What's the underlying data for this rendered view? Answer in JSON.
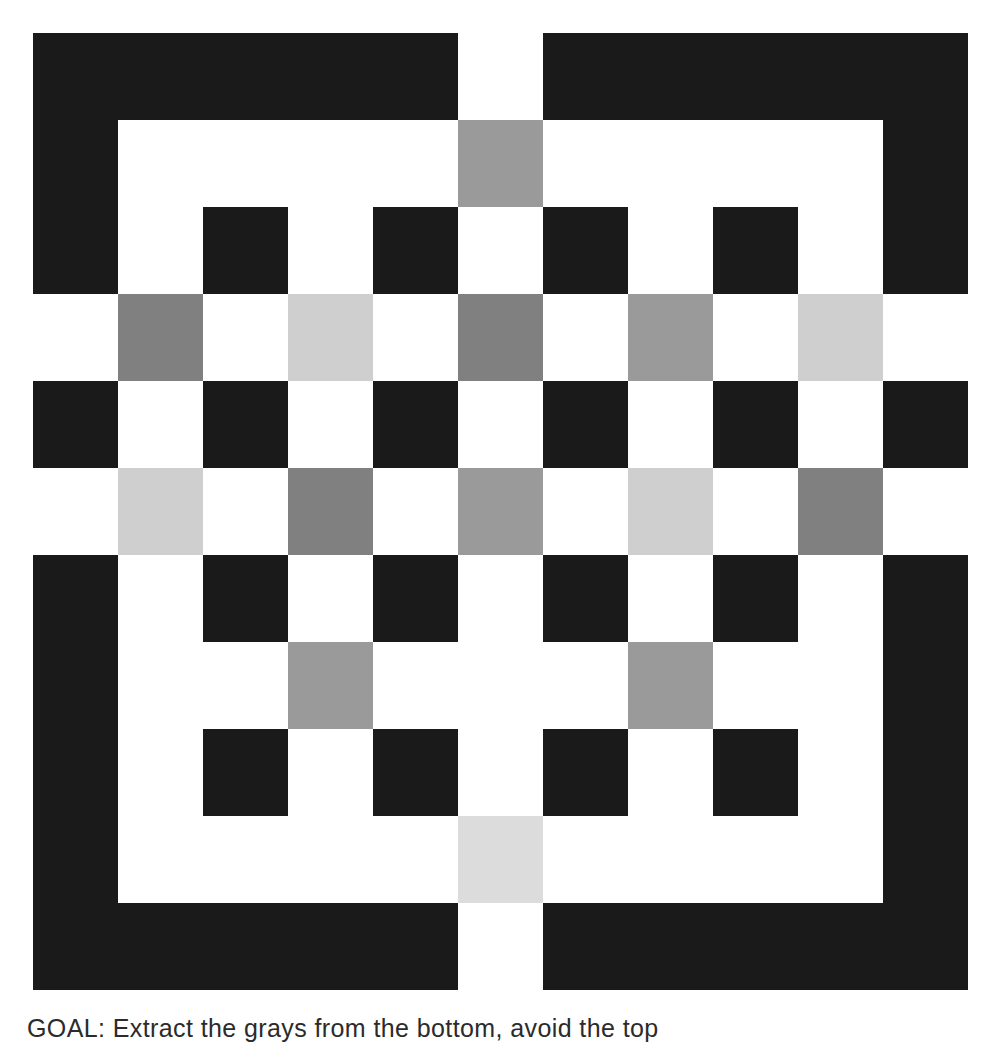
{
  "caption": {
    "label": "GOAL:",
    "text": " Extract the grays from the bottom, avoid the top"
  },
  "palette": {
    "white": "#ffffff",
    "black": "#1a1a1a",
    "gray_dark": "#808080",
    "gray_mid": "#9a9a9a",
    "gray_light": "#cfcfcf",
    "gray_pale": "#dcdcdc"
  },
  "grid": {
    "columns": 11,
    "rows": 11,
    "cell_width": 85,
    "cell_height": 87,
    "origin_x": 33,
    "origin_y": 33,
    "legend": {
      "w": "white",
      "k": "black",
      "d": "gray_dark",
      "m": "gray_mid",
      "l": "gray_light",
      "p": "gray_pale"
    },
    "cells": [
      [
        "k",
        "k",
        "k",
        "k",
        "k",
        "w",
        "k",
        "k",
        "k",
        "k",
        "k"
      ],
      [
        "k",
        "w",
        "w",
        "w",
        "w",
        "m",
        "w",
        "w",
        "w",
        "w",
        "k"
      ],
      [
        "k",
        "w",
        "k",
        "w",
        "k",
        "w",
        "k",
        "w",
        "k",
        "w",
        "k"
      ],
      [
        "w",
        "d",
        "w",
        "l",
        "w",
        "d",
        "w",
        "m",
        "w",
        "l",
        "w"
      ],
      [
        "k",
        "w",
        "k",
        "w",
        "k",
        "w",
        "k",
        "w",
        "k",
        "w",
        "k"
      ],
      [
        "w",
        "l",
        "w",
        "d",
        "w",
        "m",
        "w",
        "l",
        "w",
        "d",
        "w"
      ],
      [
        "k",
        "w",
        "k",
        "w",
        "k",
        "w",
        "k",
        "w",
        "k",
        "w",
        "k"
      ],
      [
        "k",
        "w",
        "w",
        "m",
        "w",
        "w",
        "w",
        "m",
        "w",
        "w",
        "k"
      ],
      [
        "k",
        "w",
        "k",
        "w",
        "k",
        "w",
        "k",
        "w",
        "k",
        "w",
        "k"
      ],
      [
        "k",
        "w",
        "w",
        "w",
        "w",
        "p",
        "w",
        "w",
        "w",
        "w",
        "k"
      ],
      [
        "k",
        "k",
        "k",
        "k",
        "k",
        "w",
        "k",
        "k",
        "k",
        "k",
        "k"
      ]
    ]
  }
}
